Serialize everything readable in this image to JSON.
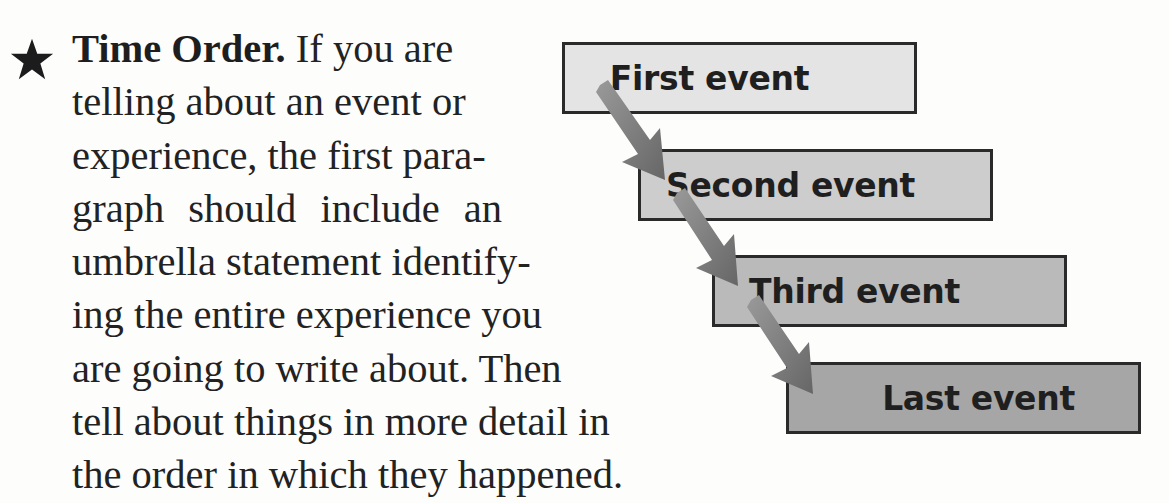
{
  "paragraph": {
    "bullet_icon": "star-icon",
    "lead": "Time Order.",
    "lines": [
      " If you are",
      "telling about an event or",
      "experience, the first para-",
      "graph should include an",
      "umbrella statement identify-",
      "ing the entire experience you",
      "are going to write about. Then",
      "tell about things in more detail in",
      "the order in which they happened."
    ]
  },
  "diagram": {
    "type": "sequence-flow",
    "events": [
      {
        "label": "First event",
        "fill": "#e4e4e4"
      },
      {
        "label": "Second event",
        "fill": "#cdcdcd"
      },
      {
        "label": "Third event",
        "fill": "#bababa"
      },
      {
        "label": "Last event",
        "fill": "#a6a6a6"
      }
    ],
    "arrow_color": "#7a7a7a",
    "border_color": "#2a2a2a"
  }
}
